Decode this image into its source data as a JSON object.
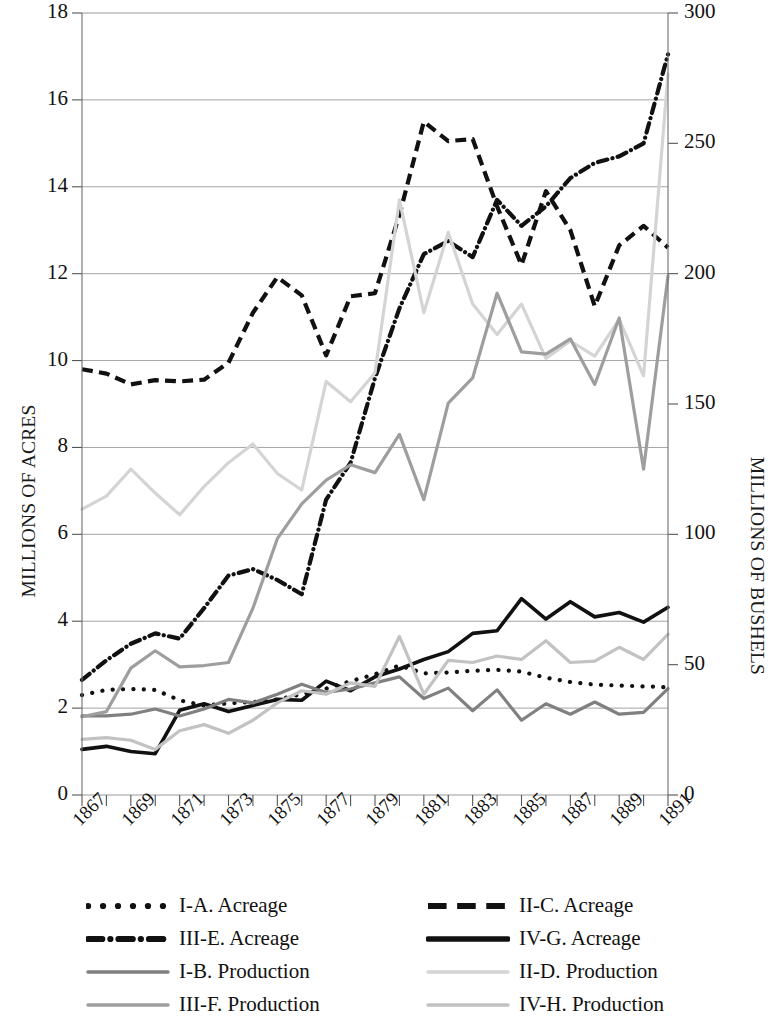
{
  "axes": {
    "left_title": "MILLIONS OF ACRES",
    "right_title": "MILLIONS OF BUSHELS",
    "left_ticks": [
      "0",
      "2",
      "4",
      "6",
      "8",
      "10",
      "12",
      "14",
      "16",
      "18"
    ],
    "right_ticks": [
      "0",
      "50",
      "100",
      "150",
      "200",
      "250",
      "300"
    ],
    "x_ticks": [
      "1867",
      "1869",
      "1871",
      "1873",
      "1875",
      "1877",
      "1879",
      "1881",
      "1883",
      "1885",
      "1887",
      "1889",
      "1891"
    ]
  },
  "legend": {
    "entries": [
      {
        "label": "I-A. Acreage",
        "style": "dotted",
        "color": "#111111"
      },
      {
        "label": "II-C. Acreage",
        "style": "dashed",
        "color": "#111111"
      },
      {
        "label": "III-E. Acreage",
        "style": "dashdot",
        "color": "#111111"
      },
      {
        "label": "IV-G. Acreage",
        "style": "solid",
        "color": "#111111"
      },
      {
        "label": "I-B. Production",
        "style": "solid",
        "color": "#808080"
      },
      {
        "label": "II-D. Production",
        "style": "solid",
        "color": "#d4d4d4"
      },
      {
        "label": "III-F. Production",
        "style": "solid",
        "color": "#9e9e9e"
      },
      {
        "label": "IV-H. Production",
        "style": "solid",
        "color": "#c2c2c2"
      }
    ]
  },
  "chart_data": {
    "type": "line",
    "title": "",
    "xlabel": "",
    "ylabel": "MILLIONS OF ACRES",
    "ylabel_right": "MILLIONS OF BUSHELS",
    "x": [
      1867,
      1868,
      1869,
      1870,
      1871,
      1872,
      1873,
      1874,
      1875,
      1876,
      1877,
      1878,
      1879,
      1880,
      1881,
      1882,
      1883,
      1884,
      1885,
      1886,
      1887,
      1888,
      1889,
      1890,
      1891
    ],
    "xlim": [
      1867,
      1891
    ],
    "ylim": [
      0,
      18
    ],
    "ylim_right": [
      0,
      300
    ],
    "grid": true,
    "legend_position": "below",
    "series": [
      {
        "name": "I-A. Acreage",
        "axis": "left",
        "style": "dotted",
        "color": "#111111",
        "values": [
          2.3,
          2.42,
          2.44,
          2.42,
          2.18,
          2.06,
          2.11,
          2.14,
          2.2,
          2.32,
          2.45,
          2.62,
          2.78,
          2.98,
          2.8,
          2.82,
          2.86,
          2.88,
          2.84,
          2.7,
          2.6,
          2.54,
          2.52,
          2.5,
          2.48
        ]
      },
      {
        "name": "II-C. Acreage",
        "axis": "left",
        "style": "dashed",
        "color": "#111111",
        "values": [
          9.8,
          9.7,
          9.45,
          9.55,
          9.52,
          9.56,
          9.95,
          11.1,
          11.92,
          11.5,
          10.12,
          11.48,
          11.55,
          13.35,
          15.5,
          15.05,
          15.1,
          13.55,
          12.2,
          13.9,
          13.0,
          11.25,
          12.65,
          13.1,
          12.6
        ]
      },
      {
        "name": "III-E. Acreage",
        "axis": "left",
        "style": "dashdot",
        "color": "#111111",
        "values": [
          2.65,
          3.1,
          3.48,
          3.72,
          3.6,
          4.3,
          5.05,
          5.2,
          4.95,
          4.62,
          6.8,
          7.65,
          9.6,
          11.2,
          12.45,
          12.75,
          12.38,
          13.7,
          13.1,
          13.55,
          14.2,
          14.55,
          14.7,
          15.0,
          17.05
        ]
      },
      {
        "name": "IV-G. Acreage",
        "axis": "left",
        "style": "solid",
        "color": "#111111",
        "values": [
          1.05,
          1.12,
          1.0,
          0.95,
          1.95,
          2.1,
          1.92,
          2.06,
          2.2,
          2.18,
          2.62,
          2.4,
          2.72,
          2.9,
          3.12,
          3.3,
          3.72,
          3.78,
          4.52,
          4.05,
          4.45,
          4.1,
          4.2,
          3.98,
          4.32
        ]
      },
      {
        "name": "I-B. Production",
        "axis": "left",
        "style": "solid",
        "color": "#808080",
        "values": [
          1.82,
          1.82,
          1.86,
          1.98,
          1.82,
          1.98,
          2.2,
          2.12,
          2.32,
          2.55,
          2.36,
          2.44,
          2.58,
          2.72,
          2.22,
          2.46,
          1.94,
          2.42,
          1.72,
          2.1,
          1.86,
          2.14,
          1.86,
          1.9,
          2.45
        ]
      },
      {
        "name": "II-D. Production",
        "axis": "left",
        "style": "solid",
        "color": "#d4d4d4",
        "values": [
          6.58,
          6.88,
          7.5,
          6.95,
          6.45,
          7.1,
          7.65,
          8.08,
          7.4,
          7.02,
          9.52,
          9.05,
          9.72,
          13.7,
          11.1,
          12.95,
          11.3,
          10.6,
          11.3,
          10.05,
          10.45,
          10.1,
          10.95,
          9.65,
          16.6
        ]
      },
      {
        "name": "III-F. Production",
        "axis": "left",
        "style": "solid",
        "color": "#9e9e9e",
        "values": [
          1.8,
          1.92,
          2.92,
          3.32,
          2.95,
          2.98,
          3.05,
          4.3,
          5.9,
          6.7,
          7.25,
          7.6,
          7.42,
          8.3,
          6.8,
          9.02,
          9.6,
          11.55,
          10.2,
          10.15,
          10.5,
          9.45,
          10.98,
          7.5,
          11.95
        ]
      },
      {
        "name": "IV-H. Production",
        "axis": "left",
        "style": "solid",
        "color": "#c2c2c2",
        "values": [
          1.28,
          1.32,
          1.26,
          1.05,
          1.48,
          1.62,
          1.42,
          1.72,
          2.12,
          2.4,
          2.32,
          2.58,
          2.5,
          3.65,
          2.32,
          3.1,
          3.05,
          3.2,
          3.12,
          3.55,
          3.05,
          3.08,
          3.4,
          3.12,
          3.7
        ]
      }
    ]
  }
}
